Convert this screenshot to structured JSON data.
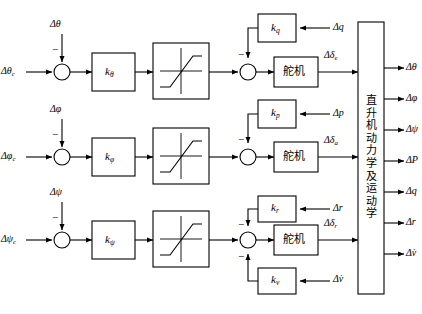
{
  "diagram": {
    "width": 422,
    "height": 314,
    "stroke_color": "#000000",
    "background": "#ffffff"
  },
  "channels": [
    {
      "name": "pitch",
      "command_input": "Δθ",
      "command_subscript": "c",
      "feedback_input": "Δθ",
      "feedback_sign": "−",
      "gain_label": "k",
      "gain_subscript": "θ",
      "nonlinearity": "saturation",
      "rate_gain_label": "k",
      "rate_gain_subscript": "q",
      "rate_input": "Δq",
      "rate_sign": "−",
      "servo_label": "舵机",
      "servo_output": "Δδ",
      "servo_output_subscript": "e"
    },
    {
      "name": "roll",
      "command_input": "Δφ",
      "command_subscript": "c",
      "feedback_input": "Δφ",
      "feedback_sign": "−",
      "gain_label": "k",
      "gain_subscript": "φ",
      "nonlinearity": "saturation",
      "rate_gain_label": "k",
      "rate_gain_subscript": "p",
      "rate_input": "Δp",
      "rate_sign": "−",
      "servo_label": "舵机",
      "servo_output": "Δδ",
      "servo_output_subscript": "a"
    },
    {
      "name": "yaw",
      "command_input": "Δψ",
      "command_subscript": "c",
      "feedback_input": "Δψ",
      "feedback_sign": "−",
      "gain_label": "k",
      "gain_subscript": "ψ",
      "nonlinearity": "saturation",
      "rate_gain_label": "k",
      "rate_gain_subscript": "r",
      "rate_input": "Δr",
      "rate_sign": "−",
      "servo_label": "舵机",
      "servo_output": "Δδ",
      "servo_output_subscript": "r",
      "aux_gain_label": "k",
      "aux_gain_subscript": "v",
      "aux_input": "Δv̇",
      "aux_sign": "−"
    }
  ],
  "plant": {
    "label": "直升机动力学及运动学",
    "chars": [
      "直",
      "升",
      "机",
      "动",
      "力",
      "学",
      "及",
      "运",
      "动",
      "学"
    ],
    "outputs": [
      {
        "symbol": "Δθ",
        "name": "pitch-attitude"
      },
      {
        "symbol": "Δφ",
        "name": "roll-attitude"
      },
      {
        "symbol": "Δψ",
        "name": "yaw-attitude"
      },
      {
        "symbol": "ΔP",
        "name": "roll-rate"
      },
      {
        "symbol": "Δq",
        "name": "pitch-rate"
      },
      {
        "symbol": "Δr",
        "name": "yaw-rate"
      },
      {
        "symbol": "Δv̇",
        "name": "lateral-accel"
      }
    ]
  }
}
